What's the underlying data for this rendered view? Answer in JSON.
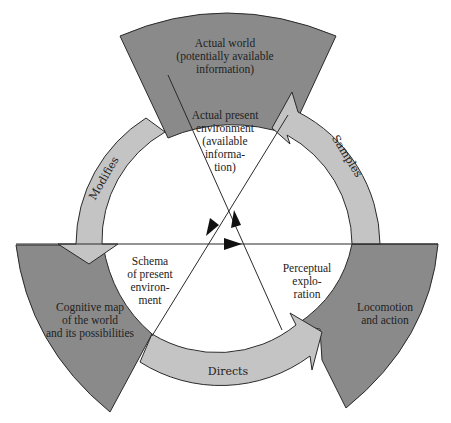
{
  "diagram": {
    "colors": {
      "sector_fill": "#8a8a8a",
      "ring_fill": "#c4c4c4",
      "stroke": "#2a2a2a",
      "background": "#ffffff"
    },
    "sectors": [
      {
        "id": "top",
        "lines": [
          "Actual world",
          "(potentially available",
          "information)"
        ]
      },
      {
        "id": "left",
        "lines": [
          "Cognitive map",
          "of the world",
          "and its possibilities"
        ]
      },
      {
        "id": "right",
        "lines": [
          "Locomotion",
          "and action"
        ]
      }
    ],
    "inner_labels": [
      {
        "id": "top",
        "lines": [
          "Actual present",
          "environment",
          "(available",
          "informa-",
          "tion)"
        ]
      },
      {
        "id": "left",
        "lines": [
          "Schema",
          "of present",
          "environ-",
          "ment"
        ]
      },
      {
        "id": "right",
        "lines": [
          "Perceptual",
          "explo-",
          "ration"
        ]
      }
    ],
    "arrows": [
      {
        "id": "modifies",
        "label": "Modifies",
        "from": "Actual world",
        "to": "Cognitive map"
      },
      {
        "id": "directs",
        "label": "Directs",
        "from": "Cognitive map",
        "to": "Locomotion and action"
      },
      {
        "id": "samples",
        "label": "Samples",
        "from": "Locomotion and action",
        "to": "Actual world"
      }
    ]
  }
}
